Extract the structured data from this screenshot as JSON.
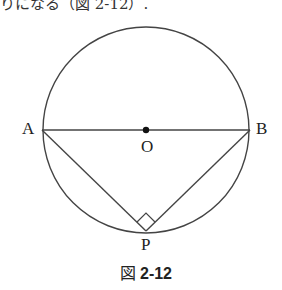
{
  "top_text": "りになる（図 2-12）.",
  "diagram": {
    "circle": {
      "cx": 146,
      "cy": 130,
      "r": 104
    },
    "points": {
      "A": {
        "label": "A",
        "x": 42,
        "y": 130
      },
      "B": {
        "label": "B",
        "x": 250,
        "y": 130
      },
      "O": {
        "label": "O",
        "x": 146,
        "y": 130
      },
      "P": {
        "label": "P",
        "x": 146,
        "y": 230
      }
    },
    "right_angle_marker_at": "P"
  },
  "caption": {
    "prefix": "図",
    "number": "2-12"
  }
}
